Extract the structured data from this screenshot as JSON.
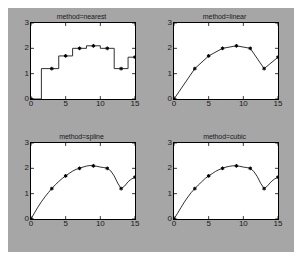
{
  "figure": {
    "background_color": "#a6a6a6",
    "axes_background_color": "#ffffff",
    "line_color": "#1a1a1a",
    "marker_color": "#000000"
  },
  "chart_data": [
    {
      "type": "line",
      "title": "method=nearest",
      "xlabel": "",
      "ylabel": "",
      "xlim": [
        0,
        15
      ],
      "ylim": [
        0,
        3
      ],
      "xticks": [
        0,
        5,
        10,
        15
      ],
      "yticks": [
        0,
        1,
        2,
        3
      ],
      "xticklabels": [
        "0",
        "5",
        "10",
        "15"
      ],
      "yticklabels": [
        "0",
        "1",
        "2",
        "3"
      ],
      "grid": false,
      "legend": "none",
      "interpolation": "nearest",
      "marker": "star",
      "x": [
        0,
        3,
        5,
        7,
        9,
        11,
        13,
        15
      ],
      "values": [
        0,
        1.2,
        1.7,
        2.0,
        2.1,
        2.0,
        1.2,
        1.65
      ],
      "dense_x": [
        0,
        1.5,
        1.5,
        4,
        4,
        6,
        6,
        8,
        8,
        10,
        10,
        12,
        12,
        14,
        14,
        15
      ],
      "dense_y": [
        0,
        0,
        1.2,
        1.2,
        1.7,
        1.7,
        2.0,
        2.0,
        2.1,
        2.1,
        2.0,
        2.0,
        1.2,
        1.2,
        1.65,
        1.65
      ]
    },
    {
      "type": "line",
      "title": "method=linear",
      "xlabel": "",
      "ylabel": "",
      "xlim": [
        0,
        15
      ],
      "ylim": [
        0,
        3
      ],
      "xticks": [
        0,
        5,
        10,
        15
      ],
      "yticks": [
        0,
        1,
        2,
        3
      ],
      "xticklabels": [
        "0",
        "5",
        "10",
        "15"
      ],
      "yticklabels": [
        "0",
        "1",
        "2",
        "3"
      ],
      "grid": false,
      "legend": "none",
      "interpolation": "linear",
      "marker": "star",
      "x": [
        0,
        3,
        5,
        7,
        9,
        11,
        13,
        15
      ],
      "values": [
        0,
        1.2,
        1.7,
        2.0,
        2.1,
        2.0,
        1.2,
        1.65
      ],
      "dense_x": [
        0,
        3,
        5,
        7,
        9,
        11,
        13,
        15
      ],
      "dense_y": [
        0,
        1.2,
        1.7,
        2.0,
        2.1,
        2.0,
        1.2,
        1.65
      ]
    },
    {
      "type": "line",
      "title": "method=spline",
      "xlabel": "",
      "ylabel": "",
      "xlim": [
        0,
        15
      ],
      "ylim": [
        0,
        3
      ],
      "xticks": [
        0,
        5,
        10,
        15
      ],
      "yticks": [
        0,
        1,
        2,
        3
      ],
      "xticklabels": [
        "0",
        "5",
        "10",
        "15"
      ],
      "yticklabels": [
        "0",
        "1",
        "2",
        "3"
      ],
      "grid": false,
      "legend": "none",
      "interpolation": "spline",
      "marker": "star",
      "x": [
        0,
        3,
        5,
        7,
        9,
        11,
        13,
        15
      ],
      "values": [
        0,
        1.2,
        1.7,
        2.0,
        2.1,
        2.0,
        1.2,
        1.65
      ],
      "dense_x": [
        0,
        0.5,
        1,
        1.5,
        2,
        2.5,
        3,
        3.5,
        4,
        4.5,
        5,
        5.5,
        6,
        6.5,
        7,
        7.5,
        8,
        8.5,
        9,
        9.5,
        10,
        10.5,
        11,
        11.5,
        12,
        12.5,
        13,
        13.5,
        14,
        14.5,
        15
      ],
      "dense_y": [
        0,
        0.24,
        0.47,
        0.68,
        0.87,
        1.04,
        1.2,
        1.35,
        1.48,
        1.6,
        1.7,
        1.8,
        1.89,
        1.96,
        2.0,
        2.05,
        2.09,
        2.11,
        2.1,
        2.08,
        2.05,
        2.03,
        2.0,
        1.9,
        1.7,
        1.42,
        1.2,
        1.3,
        1.47,
        1.58,
        1.65
      ]
    },
    {
      "type": "line",
      "title": "method=cubic",
      "xlabel": "",
      "ylabel": "",
      "xlim": [
        0,
        15
      ],
      "ylim": [
        0,
        3
      ],
      "xticks": [
        0,
        5,
        10,
        15
      ],
      "yticks": [
        0,
        1,
        2,
        3
      ],
      "xticklabels": [
        "0",
        "5",
        "10",
        "15"
      ],
      "yticklabels": [
        "0",
        "1",
        "2",
        "3"
      ],
      "grid": false,
      "legend": "none",
      "interpolation": "cubic",
      "marker": "star",
      "x": [
        0,
        3,
        5,
        7,
        9,
        11,
        13,
        15
      ],
      "values": [
        0,
        1.2,
        1.7,
        2.0,
        2.1,
        2.0,
        1.2,
        1.65
      ],
      "dense_x": [
        0,
        0.5,
        1,
        1.5,
        2,
        2.5,
        3,
        3.5,
        4,
        4.5,
        5,
        5.5,
        6,
        6.5,
        7,
        7.5,
        8,
        8.5,
        9,
        9.5,
        10,
        10.5,
        11,
        11.5,
        12,
        12.5,
        13,
        13.5,
        14,
        14.5,
        15
      ],
      "dense_y": [
        0,
        0.22,
        0.45,
        0.67,
        0.87,
        1.05,
        1.2,
        1.34,
        1.47,
        1.6,
        1.7,
        1.79,
        1.88,
        1.95,
        2.0,
        2.05,
        2.08,
        2.1,
        2.1,
        2.08,
        2.05,
        2.03,
        2.0,
        1.88,
        1.68,
        1.41,
        1.2,
        1.31,
        1.47,
        1.58,
        1.65
      ]
    }
  ]
}
